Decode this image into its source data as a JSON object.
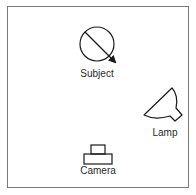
{
  "diagram": {
    "type": "lighting-setup",
    "elements": [
      {
        "id": "subject",
        "label": "Subject",
        "icon": "circle-with-arrow-icon"
      },
      {
        "id": "lamp",
        "label": "Lamp",
        "icon": "lamp-icon"
      },
      {
        "id": "camera",
        "label": "Camera",
        "icon": "camera-icon"
      }
    ],
    "colors": {
      "stroke": "#1a1a1a",
      "border": "#7a7a7a",
      "background": "#ffffff"
    }
  }
}
